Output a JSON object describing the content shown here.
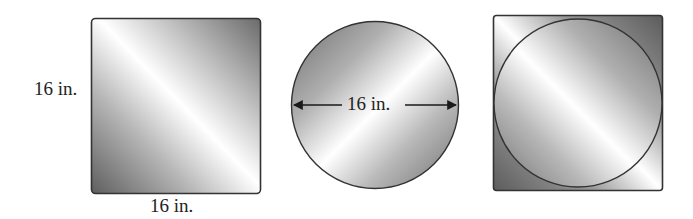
{
  "figures": {
    "square": {
      "side_label": "16 in.",
      "bottom_label": "16 in."
    },
    "circle": {
      "diameter_label": "16 in."
    },
    "circle_in_square": {
      "description": "circle inscribed in square"
    }
  },
  "colors": {
    "stroke": "#333333",
    "gradient_dark": "#6a6a6a",
    "gradient_mid": "#b5b5b5",
    "gradient_light": "#ffffff"
  }
}
